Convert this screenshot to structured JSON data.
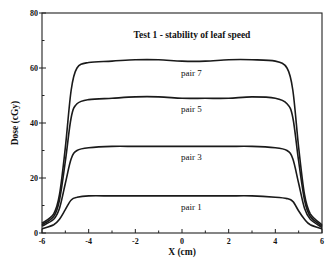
{
  "chart_data": {
    "type": "line",
    "title": "Test 1 - stability of leaf speed",
    "xlabel": "X (cm)",
    "ylabel": "Dose (cGy)",
    "xlim": [
      -6,
      6
    ],
    "ylim": [
      0,
      80
    ],
    "x_ticks": [
      -6,
      -4,
      -2,
      0,
      2,
      4,
      6
    ],
    "x_minor_ticks": [
      -5,
      -3,
      -1,
      1,
      3,
      5
    ],
    "y_ticks": [
      0,
      20,
      40,
      60,
      80
    ],
    "y_minor_ticks": [
      10,
      30,
      50,
      70
    ],
    "grid": false,
    "legend": "inline labels under each curve",
    "field_edges_cm": [
      -4.9,
      4.9
    ],
    "x": [
      -6,
      -5.5,
      -5.25,
      -5,
      -4.75,
      -4.5,
      -4,
      -3,
      -2,
      -1,
      0,
      1,
      2,
      3,
      4,
      4.5,
      4.75,
      5,
      5.25,
      5.5,
      6
    ],
    "series": [
      {
        "name": "pair 7",
        "plateau": 62.5,
        "values": [
          3.5,
          7,
          14,
          31,
          52,
          60,
          62,
          62.5,
          63,
          63,
          62.5,
          62.5,
          63,
          63,
          62.5,
          60,
          52,
          31,
          14,
          7,
          3
        ]
      },
      {
        "name": "pair 5",
        "plateau": 49,
        "values": [
          3,
          6,
          12,
          26,
          42,
          47,
          48.5,
          49,
          49.5,
          49.5,
          49,
          49,
          49,
          49.5,
          49,
          47,
          42,
          26,
          12,
          6,
          2.5
        ]
      },
      {
        "name": "pair 3",
        "plateau": 31.5,
        "values": [
          2.5,
          5,
          9,
          18,
          27,
          30,
          31,
          31.5,
          31.5,
          31.5,
          31.5,
          31.5,
          31.5,
          31.5,
          31,
          30,
          27,
          18,
          9,
          5,
          2
        ]
      },
      {
        "name": "pair 1",
        "plateau": 13.5,
        "values": [
          1.5,
          3,
          5,
          8.5,
          12,
          13,
          13.5,
          13.5,
          13.5,
          13.5,
          13.5,
          13.5,
          13.5,
          13.5,
          13,
          12.5,
          11.5,
          8,
          5,
          3,
          1.5
        ]
      }
    ],
    "series_label_positions": [
      {
        "name": "pair 7",
        "x_cm": 0.4,
        "y": 57
      },
      {
        "name": "pair 5",
        "x_cm": 0.4,
        "y": 44
      },
      {
        "name": "pair 3",
        "x_cm": 0.4,
        "y": 26.5
      },
      {
        "name": "pair 1",
        "x_cm": 0.4,
        "y": 8.5
      }
    ]
  }
}
